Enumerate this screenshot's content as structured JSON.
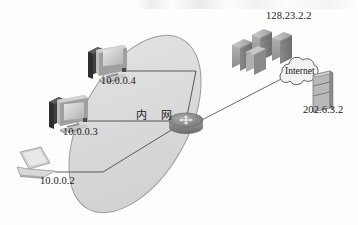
{
  "diagram": {
    "zone_label_left": "内",
    "zone_label_right": "网",
    "nodes": {
      "workstation_top": {
        "name": "workstation",
        "ip": "10.0.0.4"
      },
      "workstation_mid": {
        "name": "workstation",
        "ip": "10.0.0.3"
      },
      "laptop": {
        "name": "laptop",
        "ip": "10.0.0.2"
      },
      "router": {
        "name": "router",
        "ip": ""
      },
      "server_rack": {
        "name": "server-rack",
        "ip": "128.23.2.2"
      },
      "cloud": {
        "name": "internet-cloud",
        "label": "Internet"
      },
      "server_small": {
        "name": "server",
        "ip": "202.6.3.2"
      }
    },
    "colors": {
      "zone_fill": "#dcdcdc",
      "zone_stroke": "#9a9a9a",
      "link": "#4a4a4a",
      "device_light": "#c9c9c9",
      "device_mid": "#a6a6a6",
      "device_dark": "#4a4a4a",
      "router_body": "#8c8c8c",
      "text": "#1b1b1b"
    }
  }
}
